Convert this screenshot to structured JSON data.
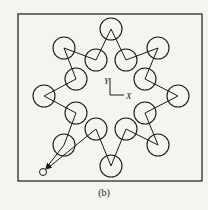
{
  "caption": "(b)",
  "axes": {
    "x_label": "X",
    "y_label": "Y"
  },
  "colors": {
    "stroke": "#1a1a1a",
    "background": "#f4f4f1"
  },
  "frame": {
    "x": 18,
    "y": 14,
    "w": 184,
    "h": 167
  },
  "circle_radius": 11,
  "start_point": {
    "x": 43,
    "y": 172,
    "r": 3.5
  },
  "circles": [
    {
      "x": 64,
      "y": 145
    },
    {
      "x": 76,
      "y": 113
    },
    {
      "x": 44,
      "y": 96
    },
    {
      "x": 76,
      "y": 79
    },
    {
      "x": 64,
      "y": 48
    },
    {
      "x": 96,
      "y": 60
    },
    {
      "x": 111,
      "y": 29
    },
    {
      "x": 126,
      "y": 60
    },
    {
      "x": 158,
      "y": 48
    },
    {
      "x": 145,
      "y": 79
    },
    {
      "x": 178,
      "y": 96
    },
    {
      "x": 145,
      "y": 113
    },
    {
      "x": 158,
      "y": 145
    },
    {
      "x": 126,
      "y": 129
    },
    {
      "x": 111,
      "y": 166
    },
    {
      "x": 96,
      "y": 129
    }
  ]
}
